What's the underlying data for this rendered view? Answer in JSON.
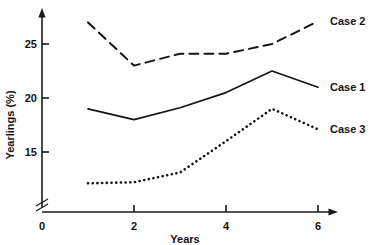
{
  "chart_data": {
    "type": "line",
    "title": "",
    "xlabel": "Years",
    "ylabel": "Yearlings (%)",
    "x": [
      1,
      2,
      3,
      4,
      5,
      6
    ],
    "xlim": [
      0,
      6
    ],
    "ylim": [
      11,
      28
    ],
    "grid": false,
    "legend_position": "right-inline",
    "axis_break": true,
    "xticks": [
      {
        "value": 0,
        "label": "0"
      },
      {
        "value": 2,
        "label": "2"
      },
      {
        "value": 4,
        "label": "4"
      },
      {
        "value": 6,
        "label": "6"
      }
    ],
    "yticks": [
      {
        "value": 15,
        "label": "15"
      },
      {
        "value": 20,
        "label": "20"
      },
      {
        "value": 25,
        "label": "25"
      }
    ],
    "series": [
      {
        "name": "Case 1",
        "label": "Case 1",
        "style": "solid",
        "color": "#141414",
        "values": [
          19.0,
          18.0,
          19.1,
          20.5,
          22.5,
          21.0
        ]
      },
      {
        "name": "Case 2",
        "label": "Case 2",
        "style": "dashed",
        "color": "#141414",
        "values": [
          27.0,
          23.0,
          24.1,
          24.1,
          25.0,
          27.1
        ]
      },
      {
        "name": "Case 3",
        "label": "Case 3",
        "style": "dotted",
        "color": "#141414",
        "values": [
          12.1,
          12.2,
          13.1,
          16.0,
          19.0,
          17.1
        ]
      }
    ]
  },
  "labels": {
    "case1": "Case 1",
    "case2": "Case 2",
    "case3": "Case 3",
    "xaxis": "Years",
    "yaxis": "Yearlings (%)",
    "tick_x_0": "0",
    "tick_x_2": "2",
    "tick_x_4": "4",
    "tick_x_6": "6",
    "tick_y_15": "15",
    "tick_y_20": "20",
    "tick_y_25": "25"
  }
}
